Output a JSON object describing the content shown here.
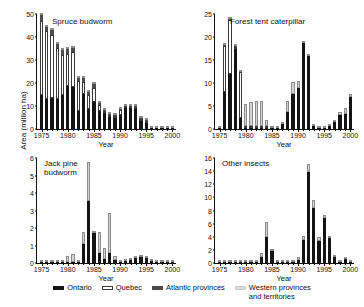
{
  "figure": {
    "y_axis_title": "Area (million ha)",
    "x_axis_title_left": "Year",
    "x_axis_title_right": "Year"
  },
  "legend": {
    "position": "bottom-center",
    "items": [
      {
        "label": "Ontario",
        "color": "#141414",
        "key": "ontario"
      },
      {
        "label": "Quebec",
        "color": "#ffffff",
        "key": "quebec"
      },
      {
        "label": "Atlantic provinces",
        "color": "#4c4c4c",
        "key": "atlantic"
      },
      {
        "label": "Western provinces\nand territories",
        "color": "#d9d9d9",
        "key": "western"
      }
    ]
  },
  "chart_data": [
    {
      "type": "bar",
      "stacked": true,
      "panel": "top-left",
      "title": "Spruce budworm",
      "xlabel": "Year",
      "ylabel": "Area (million ha)",
      "xlim": [
        1975,
        2000
      ],
      "ylim": [
        0,
        50
      ],
      "yticks": [
        0,
        10,
        20,
        30,
        40,
        50
      ],
      "xticks": [
        1975,
        1980,
        1985,
        1990,
        1995,
        2000
      ],
      "grid": false,
      "categories": [
        1975,
        1976,
        1977,
        1978,
        1979,
        1980,
        1981,
        1982,
        1983,
        1984,
        1985,
        1986,
        1987,
        1988,
        1989,
        1990,
        1991,
        1992,
        1993,
        1994,
        1995,
        1996,
        1997,
        1998,
        1999,
        2000
      ],
      "series": [
        {
          "name": "Ontario",
          "color": "#141414",
          "values": [
            15.0,
            13.0,
            13.5,
            13.2,
            15.0,
            18.5,
            18.4,
            8.0,
            15.4,
            8.6,
            11.8,
            7.8,
            7.0,
            5.2,
            5.0,
            6.2,
            9.0,
            9.0,
            8.8,
            3.6,
            2.8,
            0.2,
            0.1,
            0.1,
            0.1,
            0.1
          ]
        },
        {
          "name": "Quebec",
          "color": "#ffffff",
          "values": [
            32.0,
            29.5,
            27.5,
            22.0,
            17.0,
            14.0,
            15.0,
            13.0,
            5.0,
            6.0,
            6.0,
            2.6,
            0.5,
            0.3,
            0.3,
            2.0,
            0.2,
            0.2,
            0.2,
            0.2,
            0.1,
            0.0,
            0.0,
            0.0,
            0.0,
            0.0
          ]
        },
        {
          "name": "Atlantic provinces",
          "color": "#4c4c4c",
          "values": [
            2.5,
            2.0,
            2.0,
            1.8,
            2.5,
            2.5,
            2.0,
            1.2,
            2.0,
            1.6,
            1.6,
            1.0,
            0.3,
            0.2,
            0.2,
            0.3,
            0.2,
            0.2,
            0.2,
            0.1,
            0.1,
            0.0,
            0.0,
            0.0,
            0.0,
            0.0
          ]
        },
        {
          "name": "Western provinces and territories",
          "color": "#d9d9d9",
          "values": [
            0.3,
            0.2,
            0.2,
            0.2,
            0.2,
            0.2,
            0.2,
            0.2,
            0.2,
            0.2,
            0.2,
            0.2,
            0.2,
            0.2,
            0.2,
            0.2,
            0.2,
            0.2,
            0.2,
            0.2,
            0.2,
            0.2,
            0.2,
            0.2,
            0.2,
            0.2
          ]
        }
      ]
    },
    {
      "type": "bar",
      "stacked": true,
      "panel": "top-right",
      "title": "Forest tent caterpillar",
      "xlabel": "Year",
      "ylabel": "Area (million ha)",
      "xlim": [
        1975,
        2000
      ],
      "ylim": [
        0,
        25
      ],
      "yticks": [
        0,
        5,
        10,
        15,
        20,
        25
      ],
      "xticks": [
        1975,
        1980,
        1985,
        1990,
        1995,
        2000
      ],
      "grid": false,
      "categories": [
        1975,
        1976,
        1977,
        1978,
        1979,
        1980,
        1981,
        1982,
        1983,
        1984,
        1985,
        1986,
        1987,
        1988,
        1989,
        1990,
        1991,
        1992,
        1993,
        1994,
        1995,
        1996,
        1997,
        1998,
        1999,
        2000
      ],
      "series": [
        {
          "name": "Ontario",
          "color": "#141414",
          "values": [
            0.1,
            8.0,
            12.0,
            17.5,
            2.4,
            0.1,
            0.1,
            0.1,
            0.1,
            0.1,
            0.1,
            0.1,
            1.0,
            3.6,
            7.6,
            9.0,
            18.7,
            15.8,
            0.6,
            0.2,
            0.3,
            0.6,
            1.5,
            3.0,
            3.3,
            7.0
          ]
        },
        {
          "name": "Quebec",
          "color": "#ffffff",
          "values": [
            0.0,
            10.0,
            11.8,
            0.2,
            9.9,
            0.1,
            0.1,
            0.1,
            0.1,
            0.1,
            0.0,
            0.0,
            0.0,
            0.0,
            0.0,
            0.0,
            0.0,
            0.0,
            0.0,
            0.0,
            0.0,
            0.0,
            0.0,
            0.0,
            0.0,
            0.0
          ]
        },
        {
          "name": "Atlantic provinces",
          "color": "#4c4c4c",
          "values": [
            0.0,
            0.2,
            0.1,
            0.1,
            0.1,
            0.0,
            0.0,
            0.0,
            0.0,
            0.0,
            0.0,
            0.0,
            0.0,
            0.0,
            0.0,
            0.0,
            0.0,
            0.0,
            0.0,
            0.0,
            0.0,
            0.0,
            0.0,
            0.0,
            0.0,
            0.0
          ]
        },
        {
          "name": "Western provinces and territories",
          "color": "#d9d9d9",
          "values": [
            0.2,
            0.3,
            0.2,
            0.2,
            0.2,
            4.9,
            5.2,
            5.4,
            5.4,
            1.4,
            0.2,
            0.4,
            0.5,
            2.6,
            2.6,
            1.4,
            0.5,
            0.4,
            0.4,
            0.3,
            0.3,
            0.4,
            0.4,
            0.6,
            1.2,
            0.6
          ]
        }
      ]
    },
    {
      "type": "bar",
      "stacked": true,
      "panel": "bottom-left",
      "title": "Jack pine\nbudworm",
      "xlabel": "Year",
      "ylabel": "Area (million ha)",
      "xlim": [
        1975,
        2000
      ],
      "ylim": [
        0,
        6
      ],
      "yticks": [
        0,
        1,
        2,
        3,
        4,
        5,
        6
      ],
      "xticks": [
        1975,
        1980,
        1985,
        1990,
        1995,
        2000
      ],
      "grid": false,
      "categories": [
        1975,
        1976,
        1977,
        1978,
        1979,
        1980,
        1981,
        1982,
        1983,
        1984,
        1985,
        1986,
        1987,
        1988,
        1989,
        1990,
        1991,
        1992,
        1993,
        1994,
        1995,
        1996,
        1997,
        1998,
        1999,
        2000
      ],
      "series": [
        {
          "name": "Ontario",
          "color": "#141414",
          "values": [
            0.02,
            0.02,
            0.02,
            0.02,
            0.02,
            0.02,
            0.02,
            0.05,
            1.1,
            3.55,
            1.7,
            0.6,
            0.25,
            0.6,
            0.2,
            0.08,
            0.1,
            0.15,
            0.3,
            0.35,
            0.28,
            0.1,
            0.03,
            0.02,
            0.02,
            0.02
          ]
        },
        {
          "name": "Quebec",
          "color": "#ffffff",
          "values": [
            0.0,
            0.0,
            0.0,
            0.0,
            0.0,
            0.0,
            0.0,
            0.0,
            0.0,
            0.0,
            0.0,
            0.0,
            0.0,
            0.0,
            0.0,
            0.0,
            0.0,
            0.0,
            0.0,
            0.0,
            0.0,
            0.0,
            0.0,
            0.0,
            0.0,
            0.0
          ]
        },
        {
          "name": "Atlantic provinces",
          "color": "#4c4c4c",
          "values": [
            0.0,
            0.0,
            0.0,
            0.0,
            0.0,
            0.0,
            0.0,
            0.0,
            0.0,
            0.0,
            0.0,
            0.0,
            0.0,
            0.0,
            0.0,
            0.0,
            0.0,
            0.0,
            0.0,
            0.0,
            0.0,
            0.0,
            0.0,
            0.0,
            0.0,
            0.0
          ]
        },
        {
          "name": "Western provinces and territories",
          "color": "#d9d9d9",
          "values": [
            0.03,
            0.03,
            0.05,
            0.03,
            0.05,
            0.35,
            0.45,
            0.12,
            0.65,
            2.2,
            0.1,
            1.15,
            0.6,
            2.25,
            0.2,
            0.05,
            0.03,
            0.03,
            0.03,
            0.03,
            0.03,
            0.03,
            0.03,
            0.03,
            0.03,
            0.03
          ]
        }
      ]
    },
    {
      "type": "bar",
      "stacked": true,
      "panel": "bottom-right",
      "title": "Other insects",
      "xlabel": "Year",
      "ylabel": "Area (million ha)",
      "xlim": [
        1975,
        2000
      ],
      "ylim": [
        0,
        16
      ],
      "yticks": [
        0,
        2,
        4,
        6,
        8,
        10,
        12,
        14,
        16
      ],
      "xticks": [
        1975,
        1980,
        1985,
        1990,
        1995,
        2000
      ],
      "grid": false,
      "categories": [
        1975,
        1976,
        1977,
        1978,
        1979,
        1980,
        1981,
        1982,
        1983,
        1984,
        1985,
        1986,
        1987,
        1988,
        1989,
        1990,
        1991,
        1992,
        1993,
        1994,
        1995,
        1996,
        1997,
        1998,
        1999,
        2000
      ],
      "series": [
        {
          "name": "Ontario",
          "color": "#141414",
          "values": [
            0.05,
            0.05,
            0.05,
            0.05,
            0.05,
            0.05,
            0.05,
            0.05,
            0.9,
            3.9,
            1.8,
            0.1,
            0.05,
            0.05,
            0.05,
            0.5,
            3.5,
            13.9,
            8.4,
            3.4,
            6.9,
            3.8,
            0.9,
            0.1,
            0.6,
            0.1
          ]
        },
        {
          "name": "Quebec",
          "color": "#ffffff",
          "values": [
            0.0,
            0.0,
            0.0,
            0.0,
            0.0,
            0.0,
            0.0,
            0.0,
            0.0,
            0.0,
            0.0,
            0.0,
            0.0,
            0.0,
            0.0,
            0.0,
            0.0,
            0.0,
            0.0,
            0.0,
            0.0,
            0.0,
            0.0,
            0.0,
            0.0,
            0.0
          ]
        },
        {
          "name": "Atlantic provinces",
          "color": "#4c4c4c",
          "values": [
            0.0,
            0.0,
            0.0,
            0.0,
            0.0,
            0.0,
            0.0,
            0.0,
            0.0,
            0.0,
            0.0,
            0.0,
            0.0,
            0.0,
            0.0,
            0.0,
            0.0,
            0.0,
            0.0,
            0.0,
            0.0,
            0.0,
            0.0,
            0.0,
            0.0,
            0.0
          ]
        },
        {
          "name": "Western provinces and territories",
          "color": "#d9d9d9",
          "values": [
            0.25,
            0.3,
            0.2,
            0.2,
            0.2,
            0.2,
            0.2,
            0.25,
            0.6,
            2.3,
            0.3,
            0.15,
            0.15,
            0.15,
            0.15,
            0.35,
            0.6,
            1.2,
            1.2,
            0.5,
            0.4,
            0.3,
            0.15,
            0.3,
            0.25,
            0.1
          ]
        }
      ]
    }
  ]
}
